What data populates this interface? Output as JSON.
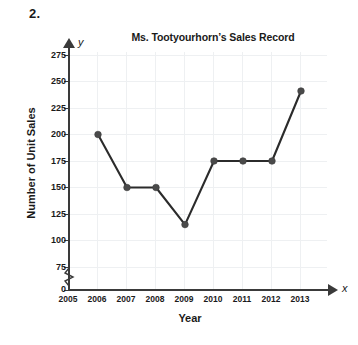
{
  "problem_number": "2.",
  "chart_data": {
    "type": "line",
    "title": "Ms. Tootyourhorn’s Sales Record",
    "xlabel": "Year",
    "ylabel": "Number of Unit Sales",
    "x_axis_letter": "x",
    "y_axis_letter": "y",
    "categories": [
      "2005",
      "2006",
      "2007",
      "2008",
      "2009",
      "2010",
      "2011",
      "2012",
      "2013"
    ],
    "values": [
      null,
      200,
      150,
      150,
      115,
      175,
      175,
      175,
      241
    ],
    "x_tick_labels": [
      "2005",
      "2006",
      "2007",
      "2008",
      "2009",
      "2010",
      "2011",
      "2012",
      "2013"
    ],
    "y_tick_labels": [
      "0",
      "75",
      "100",
      "125",
      "150",
      "175",
      "200",
      "225",
      "250",
      "275"
    ],
    "y_tick_values": [
      0,
      75,
      100,
      125,
      150,
      175,
      200,
      225,
      250,
      275
    ],
    "ylim": [
      0,
      275
    ],
    "xlim": [
      2005,
      2013
    ],
    "axis_break": true,
    "grid": true,
    "legend": null,
    "series": [
      {
        "name": "Unit Sales",
        "points": [
          {
            "x": "2006",
            "y": 200
          },
          {
            "x": "2007",
            "y": 150
          },
          {
            "x": "2008",
            "y": 150
          },
          {
            "x": "2009",
            "y": 115
          },
          {
            "x": "2010",
            "y": 175
          },
          {
            "x": "2011",
            "y": 175
          },
          {
            "x": "2012",
            "y": 175
          },
          {
            "x": "2013",
            "y": 241
          }
        ]
      }
    ],
    "colors": {
      "line": "#2b2b2b",
      "marker": "#4a4a4a",
      "grid": "#eef0f2",
      "axis": "#3a3a3a",
      "background": "#ffffff"
    }
  }
}
